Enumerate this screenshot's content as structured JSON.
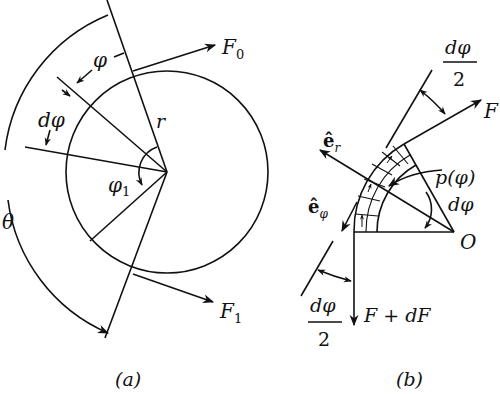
{
  "figure_a": {
    "caption": "(a)",
    "labels": {
      "F0": "F",
      "F0_sub": "0",
      "F1": "F",
      "F1_sub": "1",
      "r": "r",
      "phi": "φ",
      "dphi": "dφ",
      "phi1": "φ",
      "phi1_sub": "1",
      "theta": "θ"
    }
  },
  "figure_b": {
    "caption": "(b)",
    "labels": {
      "dphi_half_top_num": "dφ",
      "dphi_half_top_den": "2",
      "F": "F",
      "er": "ê",
      "er_sub": "r",
      "ephi": "ê",
      "ephi_sub": "φ",
      "p_phi": "p(φ)",
      "dphi": "dφ",
      "O": "O",
      "F_plus_dF": "F + dF",
      "dphi_half_bottom_num": "dφ",
      "dphi_half_bottom_den": "2"
    }
  },
  "colors": {
    "stroke": "#111111",
    "background": "#ffffff"
  }
}
